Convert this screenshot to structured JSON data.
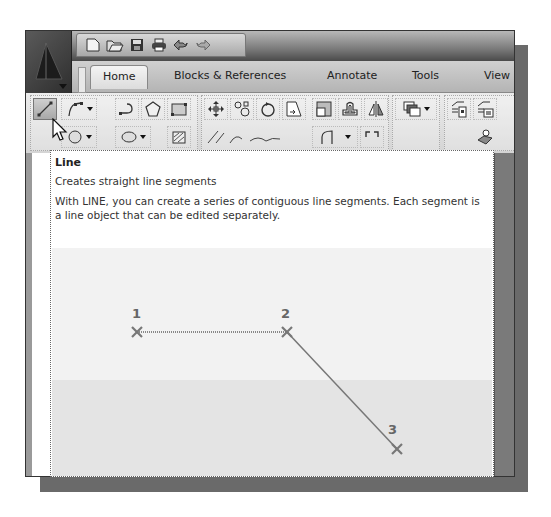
{
  "app": {
    "quick_access_toolbar": [
      {
        "name": "new-icon"
      },
      {
        "name": "open-icon"
      },
      {
        "name": "save-icon"
      },
      {
        "name": "print-icon"
      },
      {
        "name": "undo-icon"
      },
      {
        "name": "redo-icon"
      }
    ]
  },
  "ribbon": {
    "tabs": [
      {
        "label": "Home",
        "active": true
      },
      {
        "label": "Blocks & References",
        "active": false
      },
      {
        "label": "Annotate",
        "active": false
      },
      {
        "label": "Tools",
        "active": false
      },
      {
        "label": "View",
        "active": false
      }
    ],
    "draw_tools": [
      "line",
      "polyline",
      "arc",
      "polygon",
      "rectangle",
      "circle",
      "ellipse",
      "hatch"
    ],
    "modify_tools": [
      "move",
      "copy",
      "rotate",
      "stretch",
      "scale",
      "offset",
      "mirror",
      "arrange",
      "fillet"
    ],
    "block_tools": [
      "insert-block",
      "create-block",
      "layer-properties"
    ]
  },
  "tooltip": {
    "title": "Line",
    "subtitle": "Creates straight line segments",
    "description": "With LINE, you can create a series of contiguous line segments. Each segment is a line object that can be edited separately.",
    "illustration": {
      "points": [
        {
          "label": "1",
          "x": 85,
          "y": 84
        },
        {
          "label": "2",
          "x": 235,
          "y": 84
        },
        {
          "label": "3",
          "x": 345,
          "y": 201
        }
      ]
    }
  },
  "colors": {
    "window_frame": "#8c8c8c",
    "shadow": "#6a6a6a",
    "tooltip_bg": "#ffffff",
    "illustration_line": "#777777"
  }
}
